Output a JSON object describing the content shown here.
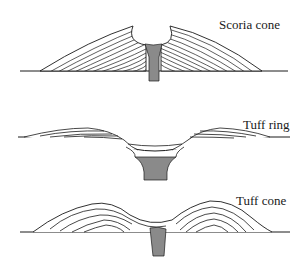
{
  "diagram": {
    "colors": {
      "line": "#1a1a1a",
      "conduit_fill": "#8a8a8a",
      "background": "#ffffff"
    },
    "panels": [
      {
        "id": "scoria-cone",
        "label": "Scoria cone"
      },
      {
        "id": "tuff-ring",
        "label": "Tuff ring"
      },
      {
        "id": "tuff-cone",
        "label": "Tuff cone"
      }
    ]
  }
}
